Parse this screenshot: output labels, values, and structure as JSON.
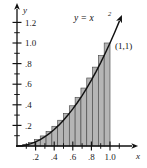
{
  "figure": {
    "title_visible": false,
    "background_color": "#ffffff"
  },
  "chart_data": {
    "type": "area",
    "title": "",
    "subtitle": "",
    "xlabel": "x",
    "ylabel": "y",
    "xlim": [
      0,
      1.17
    ],
    "ylim": [
      0,
      1.33
    ],
    "grid": false,
    "legend_position": "none",
    "curve": {
      "name": "y = x^2",
      "label_text": "y = x",
      "label_exponent": "2",
      "function": "x^2",
      "color": "#111111",
      "line_width": 1.4,
      "has_arrowhead": true,
      "x": [
        0,
        0.05,
        0.1,
        0.15,
        0.2,
        0.25,
        0.3,
        0.35,
        0.4,
        0.45,
        0.5,
        0.55,
        0.6,
        0.65,
        0.7,
        0.75,
        0.8,
        0.85,
        0.9,
        0.95,
        1.0,
        1.05,
        1.1
      ],
      "y": [
        0,
        0.0025,
        0.01,
        0.0225,
        0.04,
        0.0625,
        0.09,
        0.1225,
        0.16,
        0.2025,
        0.25,
        0.3025,
        0.36,
        0.4225,
        0.49,
        0.5625,
        0.64,
        0.7225,
        0.81,
        0.9025,
        1.0,
        1.1025,
        1.21
      ]
    },
    "annotations": [
      {
        "name": "point-one-one",
        "text": "(1,1)",
        "x": 1.0,
        "y": 1.0,
        "marker": true
      },
      {
        "name": "curve-equation",
        "text": "y = x2",
        "x": 0.82,
        "y": 1.27
      }
    ],
    "riemann_sum": {
      "method": "right-endpoint",
      "n_rectangles": 16,
      "interval": [
        0,
        1
      ],
      "delta_x": 0.0625,
      "fill_color": "#b5b5b5",
      "edge_color": "#4a4a4a",
      "right_endpoints": [
        0.0625,
        0.125,
        0.1875,
        0.25,
        0.3125,
        0.375,
        0.4375,
        0.5,
        0.5625,
        0.625,
        0.6875,
        0.75,
        0.8125,
        0.875,
        0.9375,
        1.0
      ],
      "heights": [
        0.0039,
        0.0156,
        0.0352,
        0.0625,
        0.0977,
        0.1406,
        0.1914,
        0.25,
        0.3164,
        0.3906,
        0.4727,
        0.5625,
        0.6602,
        0.7656,
        0.8789,
        1.0
      ]
    },
    "x_axis": {
      "major_ticks": [
        0.2,
        0.4,
        0.6,
        0.8,
        1.0
      ],
      "major_tick_labels": [
        ".2",
        ".4",
        ".6",
        ".8",
        "1.0"
      ],
      "minor_ticks": [
        0.1,
        0.3,
        0.5,
        0.7,
        0.9,
        1.1
      ],
      "has_arrowhead": true
    },
    "y_axis": {
      "major_ticks": [
        0.2,
        0.4,
        0.6,
        0.8,
        1.0,
        1.2
      ],
      "major_tick_labels": [
        ".2",
        ".4",
        ".6",
        ".8",
        "1.0",
        "1.2"
      ],
      "minor_ticks": [
        0.1,
        0.3,
        0.5,
        0.7,
        0.9,
        1.1
      ],
      "has_arrowhead": true
    }
  }
}
